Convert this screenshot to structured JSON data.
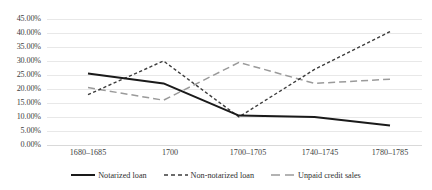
{
  "chart_data": {
    "type": "line",
    "title": "",
    "subtitle": "",
    "xlabel": "",
    "ylabel": "",
    "categories": [
      "1680–1685",
      "1700",
      "1700–1705",
      "1740–1745",
      "1780–1785"
    ],
    "ylim": [
      0,
      45
    ],
    "y_tick_step": 5,
    "y_tick_labels": [
      "45.00%",
      "40.00%",
      "35.00%",
      "30.00%",
      "25.00%",
      "20.00%",
      "15.00%",
      "10.00%",
      "5.00%",
      "0.00%"
    ],
    "y_tick_values": [
      45,
      40,
      35,
      30,
      25,
      20,
      15,
      10,
      5,
      0
    ],
    "grid": true,
    "grid_axis": "y",
    "legend_position": "bottom",
    "series": [
      {
        "name": "Notarized loan",
        "style": "solid",
        "color": "#1a1a1a",
        "values": [
          25.5,
          22.0,
          10.5,
          10.0,
          7.0
        ]
      },
      {
        "name": "Non-notarized loan",
        "style": "dashed-short",
        "color": "#3d3d3d",
        "values": [
          18.0,
          30.0,
          10.0,
          27.0,
          40.5
        ]
      },
      {
        "name": "Unpaid credit sales",
        "style": "dashed-long",
        "color": "#9a9a9a",
        "values": [
          20.5,
          16.0,
          29.5,
          22.0,
          23.5
        ]
      }
    ]
  },
  "colors": {
    "background": "#ffffff",
    "gridline": "#e8e8e8",
    "axis_line": "#d9d9d9",
    "text": "#3d3d3d",
    "series_notarized": "#1a1a1a",
    "series_non_notarized": "#3d3d3d",
    "series_unpaid": "#9a9a9a"
  }
}
